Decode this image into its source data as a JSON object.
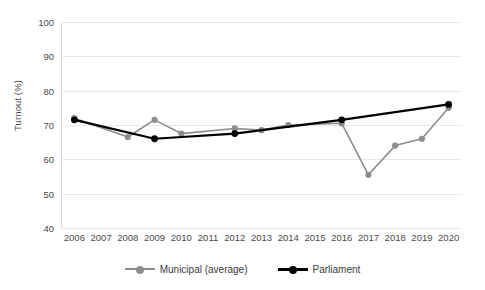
{
  "chart_data": {
    "type": "line",
    "title": "",
    "xlabel": "",
    "ylabel": "Turnout (%)",
    "ylim": [
      40,
      100
    ],
    "ytick_step": 10,
    "yticks": [
      100,
      90,
      80,
      70,
      60,
      50,
      40
    ],
    "grid": true,
    "legend_position": "bottom",
    "categories": [
      "2006",
      "2007",
      "2008",
      "2009",
      "2010",
      "2011",
      "2012",
      "2013",
      "2014",
      "2015",
      "2016",
      "2017",
      "2018",
      "2019",
      "2020"
    ],
    "series": [
      {
        "name": "Municipal (average)",
        "color": "#8c8c8c",
        "points": [
          {
            "x": "2006",
            "y": 72
          },
          {
            "x": "2008",
            "y": 66.5
          },
          {
            "x": "2009",
            "y": 71.5
          },
          {
            "x": "2010",
            "y": 67.5
          },
          {
            "x": "2012",
            "y": 69
          },
          {
            "x": "2013",
            "y": 68.5
          },
          {
            "x": "2014",
            "y": 70
          },
          {
            "x": "2016",
            "y": 70.5
          },
          {
            "x": "2017",
            "y": 55.5
          },
          {
            "x": "2018",
            "y": 64
          },
          {
            "x": "2019",
            "y": 66
          },
          {
            "x": "2020",
            "y": 75
          }
        ]
      },
      {
        "name": "Parliament",
        "color": "#000000",
        "points": [
          {
            "x": "2006",
            "y": 71.5
          },
          {
            "x": "2009",
            "y": 66
          },
          {
            "x": "2012",
            "y": 67.5
          },
          {
            "x": "2016",
            "y": 71.5
          },
          {
            "x": "2020",
            "y": 76
          }
        ]
      }
    ]
  },
  "legend": {
    "items": [
      {
        "label": "Municipal (average)",
        "color": "#8c8c8c"
      },
      {
        "label": "Parliament",
        "color": "#000000"
      }
    ]
  },
  "colors": {
    "gridline": "#e8e8e8",
    "axis": "#d9d9d9",
    "text": "#4a4a4a",
    "background": "#ffffff"
  }
}
